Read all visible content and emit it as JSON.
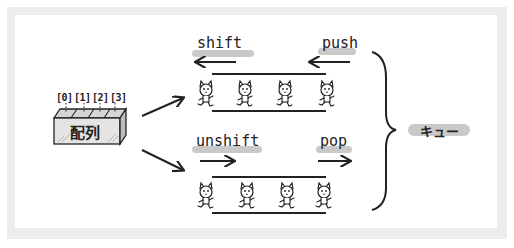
{
  "diagram": {
    "array": {
      "label": "配列",
      "indices": [
        "[0]",
        "[1]",
        "[2]",
        "[3]"
      ]
    },
    "top_queue": {
      "left_operation": "shift",
      "left_direction": "left",
      "right_operation": "push",
      "right_direction": "left",
      "items": [
        "cat",
        "cat",
        "cat",
        "cat"
      ]
    },
    "bottom_queue": {
      "left_operation": "unshift",
      "left_direction": "right",
      "right_operation": "pop",
      "right_direction": "right",
      "items": [
        "cat",
        "cat",
        "cat",
        "cat"
      ]
    },
    "group_label": "キュー",
    "colors": {
      "ink": "#222222",
      "highlight": "#c9c9c9",
      "frame": "#ececec",
      "background": "#ffffff"
    }
  }
}
